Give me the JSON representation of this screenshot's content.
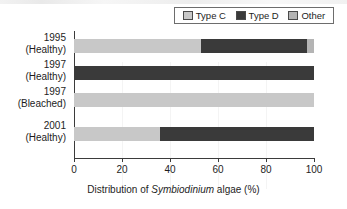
{
  "chart_data": {
    "type": "bar",
    "orientation": "horizontal",
    "stacked": true,
    "title": "",
    "xlabel": "Distribution of Symbiodinium algae (%)",
    "ylabel": "",
    "xlim": [
      0,
      100
    ],
    "xticks": [
      0,
      20,
      40,
      60,
      80,
      100
    ],
    "xticklabels": [
      "0",
      "20",
      "40",
      "60",
      "80",
      "100"
    ],
    "grid": false,
    "legend_position": "top-right",
    "categories": [
      "1995 (Healthy)",
      "1997 (Healthy)",
      "1997 (Bleached)",
      "2001 (Healthy)"
    ],
    "series": [
      {
        "name": "Type C",
        "color": "#c8c8c8",
        "values": [
          53,
          0,
          100,
          36
        ]
      },
      {
        "name": "Type D",
        "color": "#3a3a3a",
        "values": [
          44,
          100,
          0,
          64
        ]
      },
      {
        "name": "Other",
        "color": "#b4b4b4",
        "values": [
          3,
          0,
          0,
          0
        ]
      }
    ]
  },
  "legend": {
    "items": [
      {
        "label": "Type C",
        "color": "#c8c8c8"
      },
      {
        "label": "Type D",
        "color": "#3a3a3a"
      },
      {
        "label": "Other",
        "color": "#b4b4b4"
      }
    ]
  },
  "axes": {
    "y_categories": [
      {
        "year": "1995",
        "state": "(Healthy)"
      },
      {
        "year": "1997",
        "state": "(Healthy)"
      },
      {
        "year": "1997",
        "state": "(Bleached)"
      },
      {
        "year": "2001",
        "state": "(Healthy)"
      }
    ],
    "x_ticklabels": [
      "0",
      "20",
      "40",
      "60",
      "80",
      "100"
    ],
    "x_title_pre": "Distribution of ",
    "x_title_italic": "Symbiodinium",
    "x_title_post": " algae (%)"
  },
  "colors": {
    "type_c": "#c8c8c8",
    "type_d": "#3a3a3a",
    "other": "#b4b4b4",
    "axis": "#3b3b3b",
    "text": "#1d1d1d",
    "legend_border": "#6d6d6d",
    "background": "#ffffff"
  }
}
